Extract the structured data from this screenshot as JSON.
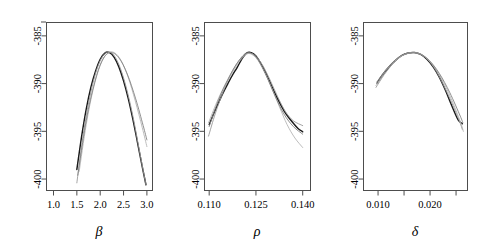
{
  "figure": {
    "type": "multi-panel-profile-likelihood",
    "panel_count": 3,
    "background_color": "#ffffff",
    "main_curve_color": "#1a1a1a",
    "alt_curve_color": "#9a9a9a"
  },
  "chart_data": [
    {
      "type": "line",
      "panel_id": "beta",
      "title": "",
      "xlabel": "β",
      "ylabel": "",
      "xlim": [
        0.85,
        3.12
      ],
      "ylim": [
        -401.2,
        -383.6
      ],
      "xticks": [
        1.0,
        1.5,
        2.0,
        2.5,
        3.0
      ],
      "xticklabels": [
        "1.0",
        "1.5",
        "2.0",
        "2.5",
        "3.0"
      ],
      "yticks": [
        -385,
        -390,
        -395,
        -400
      ],
      "yticklabels": [
        "-385",
        "-390",
        "-395",
        "-400"
      ],
      "grid": false,
      "legend": "none",
      "series": [
        {
          "name": "profile-main",
          "style": "black-bold",
          "x": [
            1.5,
            1.6,
            1.7,
            1.8,
            1.9,
            2.0,
            2.1,
            2.2,
            2.3,
            2.4,
            2.5,
            2.6,
            2.7,
            2.8,
            2.9,
            2.98
          ],
          "y": [
            -399.0,
            -395.6,
            -392.7,
            -390.4,
            -388.7,
            -387.45,
            -386.8,
            -386.75,
            -387.25,
            -388.25,
            -389.7,
            -391.55,
            -393.75,
            -396.2,
            -398.7,
            -400.6
          ]
        },
        {
          "name": "profile-alt-1",
          "style": "gray",
          "x": [
            1.5,
            1.65,
            1.8,
            1.95,
            2.1,
            2.25,
            2.4,
            2.55,
            2.7,
            2.85,
            2.98
          ],
          "y": [
            -400.4,
            -394.9,
            -390.9,
            -388.2,
            -386.85,
            -386.8,
            -388.0,
            -390.25,
            -393.4,
            -397.3,
            -400.6
          ]
        },
        {
          "name": "profile-alt-2",
          "style": "gray-light",
          "x": [
            1.55,
            1.7,
            1.85,
            2.0,
            2.15,
            2.3,
            2.45,
            2.6,
            2.75,
            2.9,
            3.0
          ],
          "y": [
            -399.2,
            -394.3,
            -390.6,
            -388.1,
            -386.85,
            -386.75,
            -387.6,
            -389.35,
            -391.8,
            -394.6,
            -396.6
          ]
        },
        {
          "name": "profile-alt-3",
          "style": "gray-dark",
          "x": [
            1.52,
            1.7,
            1.88,
            2.05,
            2.22,
            2.4,
            2.58,
            2.76,
            2.92,
            3.0
          ],
          "y": [
            -399.6,
            -393.9,
            -389.9,
            -387.5,
            -386.75,
            -387.3,
            -389.0,
            -391.6,
            -394.4,
            -395.9
          ]
        }
      ]
    },
    {
      "type": "line",
      "panel_id": "rho",
      "title": "",
      "xlabel": "ρ",
      "ylabel": "",
      "xlim": [
        0.1085,
        0.1425
      ],
      "ylim": [
        -401.2,
        -383.6
      ],
      "xticks": [
        0.11,
        0.125,
        0.14
      ],
      "xticklabels": [
        "0.110",
        "0.125",
        "0.140"
      ],
      "yticks": [
        -385,
        -390,
        -395,
        -400
      ],
      "yticklabels": [
        "-385",
        "-390",
        "-395",
        "-400"
      ],
      "grid": false,
      "legend": "none",
      "series": [
        {
          "name": "profile-main",
          "style": "black-bold",
          "x": [
            0.11,
            0.1115,
            0.113,
            0.1145,
            0.116,
            0.1175,
            0.119,
            0.1205,
            0.122,
            0.1235,
            0.125,
            0.1265,
            0.128,
            0.1295,
            0.131,
            0.1325,
            0.134,
            0.1355,
            0.137,
            0.1385,
            0.14
          ],
          "y": [
            -394.3,
            -393.1,
            -392.0,
            -390.95,
            -390.0,
            -389.1,
            -388.3,
            -387.4,
            -386.8,
            -386.75,
            -387.1,
            -387.85,
            -388.8,
            -389.85,
            -390.95,
            -391.95,
            -392.85,
            -393.55,
            -394.15,
            -394.7,
            -395.05
          ]
        },
        {
          "name": "profile-alt-1",
          "style": "gray",
          "x": [
            0.1098,
            0.112,
            0.1145,
            0.117,
            0.1195,
            0.122,
            0.1245,
            0.127,
            0.1295,
            0.132,
            0.1345,
            0.137,
            0.14
          ],
          "y": [
            -395.5,
            -393.1,
            -390.85,
            -389.0,
            -387.6,
            -386.85,
            -387.0,
            -388.0,
            -389.6,
            -391.4,
            -392.95,
            -393.9,
            -394.4
          ]
        },
        {
          "name": "profile-alt-2",
          "style": "gray-light",
          "x": [
            0.1098,
            0.1125,
            0.115,
            0.1175,
            0.12,
            0.1225,
            0.125,
            0.1275,
            0.13,
            0.1325,
            0.135,
            0.1375,
            0.14
          ],
          "y": [
            -394.1,
            -391.9,
            -390.2,
            -388.8,
            -387.55,
            -386.85,
            -387.3,
            -388.6,
            -390.4,
            -392.4,
            -394.3,
            -395.7,
            -396.7
          ]
        },
        {
          "name": "profile-alt-3",
          "style": "gray-dark",
          "x": [
            0.11,
            0.113,
            0.116,
            0.119,
            0.122,
            0.125,
            0.128,
            0.131,
            0.134,
            0.137,
            0.14
          ],
          "y": [
            -394.5,
            -391.7,
            -389.55,
            -387.85,
            -386.8,
            -387.2,
            -388.95,
            -391.2,
            -393.2,
            -394.5,
            -395.3
          ]
        }
      ]
    },
    {
      "type": "line",
      "panel_id": "delta",
      "title": "",
      "xlabel": "δ",
      "ylabel": "",
      "xlim": [
        0.0072,
        0.0272
      ],
      "ylim": [
        -401.2,
        -383.6
      ],
      "xticks": [
        0.01,
        0.015,
        0.02,
        0.025
      ],
      "xticklabels": [
        "0.010",
        "",
        "0.020",
        ""
      ],
      "yticks": [
        -385,
        -390,
        -395,
        -400
      ],
      "yticklabels": [
        "-385",
        "-390",
        "-395",
        "-400"
      ],
      "grid": false,
      "legend": "none",
      "series": [
        {
          "name": "profile-main",
          "style": "black-bold",
          "x": [
            0.0098,
            0.011,
            0.0122,
            0.0134,
            0.0146,
            0.0158,
            0.017,
            0.0182,
            0.0194,
            0.0206,
            0.0218,
            0.023,
            0.0242,
            0.0254,
            0.0262
          ],
          "y": [
            -389.95,
            -389.0,
            -388.2,
            -387.55,
            -387.05,
            -386.8,
            -386.75,
            -386.95,
            -387.45,
            -388.25,
            -389.35,
            -390.75,
            -392.35,
            -393.8,
            -394.2
          ]
        },
        {
          "name": "profile-alt-1",
          "style": "gray",
          "x": [
            0.0096,
            0.0112,
            0.0128,
            0.0144,
            0.016,
            0.0176,
            0.0192,
            0.0208,
            0.0224,
            0.024,
            0.0256,
            0.0262
          ],
          "y": [
            -390.4,
            -389.05,
            -387.95,
            -387.15,
            -386.8,
            -386.8,
            -387.3,
            -388.35,
            -389.95,
            -391.8,
            -393.85,
            -394.8
          ]
        },
        {
          "name": "profile-alt-2",
          "style": "gray-light",
          "x": [
            0.0096,
            0.0114,
            0.0132,
            0.015,
            0.0168,
            0.0186,
            0.0204,
            0.0222,
            0.024,
            0.0258,
            0.0264
          ],
          "y": [
            -390.2,
            -388.7,
            -387.65,
            -386.95,
            -386.75,
            -387.05,
            -387.95,
            -389.45,
            -391.5,
            -393.95,
            -395.0
          ]
        },
        {
          "name": "profile-alt-3",
          "style": "gray-dark",
          "x": [
            0.0098,
            0.0118,
            0.0138,
            0.0158,
            0.0178,
            0.0198,
            0.0218,
            0.0238,
            0.0258,
            0.0263
          ],
          "y": [
            -389.8,
            -388.35,
            -387.3,
            -386.8,
            -386.85,
            -387.55,
            -388.95,
            -390.95,
            -393.4,
            -394.1
          ]
        }
      ]
    }
  ]
}
